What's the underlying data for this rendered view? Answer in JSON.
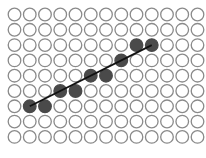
{
  "diagram": {
    "type": "line-rasterization-grid",
    "columns": 13,
    "rows": 9,
    "colors": {
      "background": "#ffffff",
      "empty_stroke": "#8a8a8a",
      "filled": "#4a4a4a",
      "line": "#111111"
    },
    "filled_cells": [
      {
        "col": 1,
        "row": 6
      },
      {
        "col": 2,
        "row": 6
      },
      {
        "col": 3,
        "row": 5
      },
      {
        "col": 4,
        "row": 5
      },
      {
        "col": 5,
        "row": 4
      },
      {
        "col": 6,
        "row": 4
      },
      {
        "col": 7,
        "row": 3
      },
      {
        "col": 8,
        "row": 2
      },
      {
        "col": 9,
        "row": 2
      }
    ],
    "line": {
      "from": {
        "col": 1,
        "row": 6
      },
      "to": {
        "col": 9,
        "row": 2
      }
    }
  }
}
